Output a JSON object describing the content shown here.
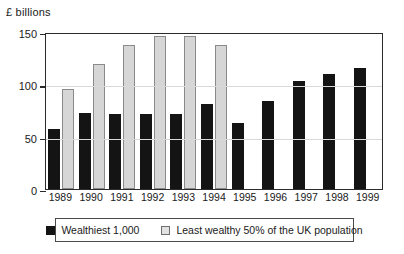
{
  "chart_data": {
    "type": "bar",
    "title": "",
    "xlabel": "",
    "ylabel": "£ billions",
    "ylim": [
      0,
      150
    ],
    "yticks": [
      0,
      50,
      100,
      150
    ],
    "ytick_labels": [
      "0",
      "50",
      "100",
      "150"
    ],
    "grid": true,
    "legend_position": "bottom",
    "categories": [
      "1989",
      "1990",
      "1991",
      "1992",
      "1993",
      "1994",
      "1995",
      "1996",
      "1997",
      "1998",
      "1999"
    ],
    "series": [
      {
        "name": "Wealthiest 1,000",
        "color": "#141414",
        "values": [
          57,
          73,
          72,
          72,
          72,
          81,
          63,
          84,
          103,
          110,
          116
        ]
      },
      {
        "name": "Least wealthy 50% of the UK population",
        "color": "#d6d6d6",
        "values": [
          96,
          119,
          138,
          146,
          146,
          138,
          null,
          null,
          null,
          null,
          null
        ]
      }
    ]
  },
  "axis": {
    "unit_caption": "£ billions"
  },
  "legend": {
    "items": [
      {
        "label": "Wealthiest 1,000",
        "swatch": "dark"
      },
      {
        "label": "Least wealthy 50% of the UK population",
        "swatch": "light"
      }
    ]
  }
}
